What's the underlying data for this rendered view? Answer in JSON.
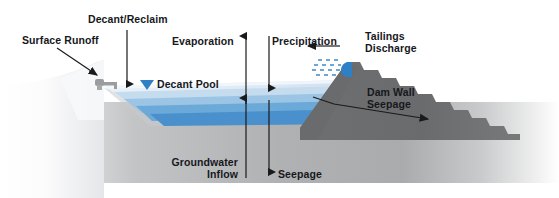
{
  "diagram": {
    "type": "cross-section-schematic",
    "canvas": {
      "width": 559,
      "height": 198
    },
    "labels": {
      "surface_runoff": "Surface Runoff",
      "decant_reclaim": "Decant/Reclaim",
      "decant_pool": "Decant Pool",
      "evaporation": "Evaporation",
      "precipitation": "Precipitation",
      "tailings_discharge_line1": "Tailings",
      "tailings_discharge_line2": "Discharge",
      "dam_wall_seepage_line1": "Dam Wall",
      "dam_wall_seepage_line2": "Seepage",
      "groundwater_inflow_line1": "Groundwater",
      "groundwater_inflow_line2": "Inflow",
      "seepage": "Seepage"
    },
    "flows": [
      {
        "name": "surface-runoff",
        "direction": "down-right",
        "into": "decant-pool"
      },
      {
        "name": "decant-reclaim",
        "direction": "down",
        "into": "decant-pool"
      },
      {
        "name": "evaporation",
        "direction": "up",
        "from": "decant-pool"
      },
      {
        "name": "precipitation",
        "direction": "down",
        "into": "decant-pool"
      },
      {
        "name": "tailings-discharge",
        "direction": "left",
        "into": "decant-pool"
      },
      {
        "name": "dam-wall-seepage",
        "direction": "right",
        "from": "decant-pool"
      },
      {
        "name": "groundwater-inflow",
        "direction": "up",
        "into": "decant-pool"
      },
      {
        "name": "seepage",
        "direction": "down",
        "from": "decant-pool"
      }
    ],
    "colors": {
      "text": "#16181c",
      "arrow": "#1a1a1a",
      "dam_wall": "#6b6b6d",
      "ground_light": "#f4f4f4",
      "ground_mid": "#b3b4b6",
      "water_pale": "#dce8f4",
      "water_light": "#b9d3ea",
      "water_mid": "#7fb2dc",
      "water_deep": "#4a90cd",
      "water_marker": "#2f7fc4",
      "spigot": "#2f7fc4",
      "decant_tower": "#9a9a9c"
    }
  }
}
